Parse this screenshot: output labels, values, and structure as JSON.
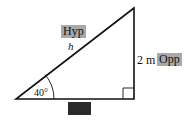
{
  "diagram": {
    "type": "right-triangle",
    "labels": {
      "hypotenuse_tag": "Hyp",
      "hypotenuse_symbol": "h",
      "opposite_value": "2 m",
      "opposite_tag": "Opp",
      "adjacent_tag": "Adj",
      "angle": "40°"
    },
    "colors": {
      "line": "#111111",
      "light_tag_bg": "#a9a9a9",
      "dark_tag_bg": "#2a2a2a"
    }
  }
}
